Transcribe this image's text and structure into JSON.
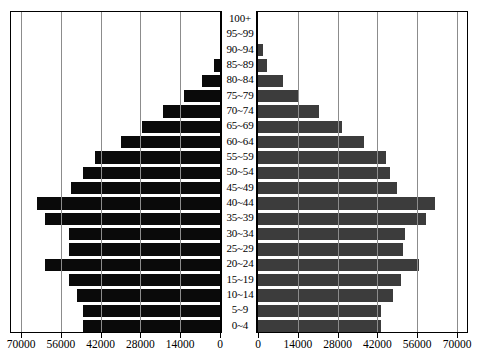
{
  "chart_data": {
    "type": "bar",
    "title": "",
    "subtype": "population-pyramid",
    "xlabel": "",
    "ylabel": "",
    "xlim": [
      0,
      70000
    ],
    "grid": true,
    "legend_position": "none",
    "categories": [
      "100+",
      "95~99",
      "90~94",
      "85~89",
      "80~84",
      "75~79",
      "70~74",
      "65~69",
      "60~64",
      "55~59",
      "50~54",
      "45~49",
      "40~44",
      "35~39",
      "30~34",
      "25~29",
      "20~24",
      "15~19",
      "10~14",
      "5~9",
      "0~4"
    ],
    "left_axis_ticks": [
      "70000",
      "56000",
      "42000",
      "28000",
      "14000",
      "0"
    ],
    "right_axis_ticks": [
      "0",
      "14000",
      "28000",
      "42000",
      "56000",
      "70000"
    ],
    "tick_values": [
      0,
      14000,
      28000,
      42000,
      56000,
      70000
    ],
    "series": [
      {
        "name": "Male",
        "side": "left",
        "color": "#0a0a0a",
        "values": [
          0,
          0,
          0,
          2100,
          6400,
          12800,
          19900,
          27600,
          34800,
          43900,
          48300,
          52300,
          64300,
          61700,
          53200,
          53200,
          61700,
          53200,
          50400,
          48300,
          48300
        ]
      },
      {
        "name": "Female",
        "side": "right",
        "color": "#3c3c3c",
        "values": [
          0,
          0,
          1750,
          3200,
          8750,
          14400,
          21400,
          29600,
          37400,
          44900,
          46300,
          49000,
          62300,
          59200,
          51800,
          51100,
          56700,
          50400,
          47600,
          43400,
          43400
        ]
      }
    ]
  }
}
